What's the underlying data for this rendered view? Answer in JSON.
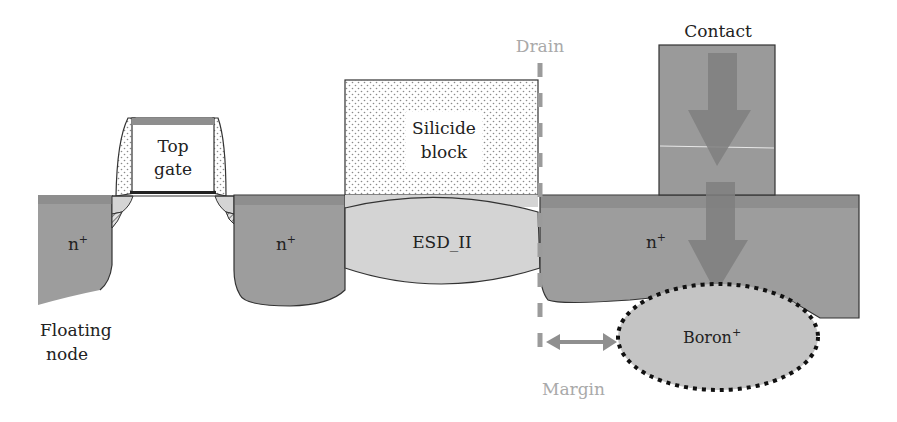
{
  "diagram": {
    "labels": {
      "top_gate_line1": "Top",
      "top_gate_line2": "gate",
      "silicide_line1": "Silicide",
      "silicide_line2": "block",
      "esd": "ESD_II",
      "n_plus_1": "n",
      "n_plus_2": "n",
      "n_plus_3": "n",
      "n_plus_sup": "+",
      "floating_line1": "Floating",
      "floating_line2": "node",
      "drain": "Drain",
      "contact": "Contact",
      "boron": "Boron",
      "boron_sup": "+",
      "margin": "Margin"
    },
    "colors": {
      "n_plus": "#9d9d9d",
      "surface_band": "#8e8e8e",
      "esd_region": "#d4d4d4",
      "boron_region": "#c4c4c4",
      "contact": "#9a9a9a",
      "arrow": "#808080",
      "drain_line": "#9b9b9b",
      "margin_arrow": "#8f8f8f",
      "outline": "#333333"
    }
  }
}
